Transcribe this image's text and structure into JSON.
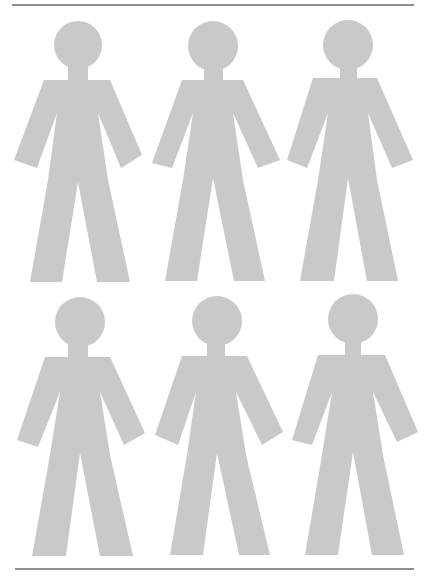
{
  "page": {
    "width": 436,
    "height": 579,
    "background": "#ffffff"
  },
  "colors": {
    "figure_fill": "#c9c9c9",
    "rule_stroke": "#6a6a6a"
  },
  "rules": [
    {
      "name": "top-rule",
      "x1": 12,
      "y1": 5,
      "x2": 414,
      "y2": 5
    },
    {
      "name": "bottom-rule",
      "x1": 15,
      "y1": 569,
      "x2": 414,
      "y2": 569
    }
  ],
  "figures": [
    {
      "id": "figure-1",
      "row": 1,
      "col": 1,
      "head": {
        "cx": 78,
        "cy": 45,
        "r": 24
      },
      "neck": {
        "x": 68,
        "y": 62,
        "w": 20,
        "h": 20
      },
      "body": [
        [
          44,
          80
        ],
        [
          110,
          80
        ],
        [
          142,
          155
        ],
        [
          121,
          168
        ],
        [
          98,
          113
        ],
        [
          108,
          180
        ],
        [
          130,
          282
        ],
        [
          97,
          282
        ],
        [
          78,
          182
        ],
        [
          62,
          282
        ],
        [
          30,
          282
        ],
        [
          48,
          180
        ],
        [
          57,
          113
        ],
        [
          37,
          168
        ],
        [
          14,
          160
        ]
      ]
    },
    {
      "id": "figure-2",
      "row": 1,
      "col": 2,
      "head": {
        "cx": 213,
        "cy": 46,
        "r": 25
      },
      "neck": {
        "x": 204,
        "y": 63,
        "w": 19,
        "h": 19
      },
      "body": [
        [
          182,
          80
        ],
        [
          243,
          80
        ],
        [
          280,
          160
        ],
        [
          258,
          168
        ],
        [
          233,
          113
        ],
        [
          243,
          180
        ],
        [
          265,
          281
        ],
        [
          234,
          281
        ],
        [
          213,
          178
        ],
        [
          197,
          281
        ],
        [
          165,
          281
        ],
        [
          183,
          180
        ],
        [
          193,
          113
        ],
        [
          172,
          168
        ],
        [
          152,
          163
        ]
      ]
    },
    {
      "id": "figure-3",
      "row": 1,
      "col": 3,
      "head": {
        "cx": 348,
        "cy": 45,
        "r": 25
      },
      "neck": {
        "x": 340,
        "y": 62,
        "w": 17,
        "h": 19
      },
      "body": [
        [
          313,
          78
        ],
        [
          377,
          78
        ],
        [
          413,
          160
        ],
        [
          392,
          168
        ],
        [
          368,
          113
        ],
        [
          377,
          180
        ],
        [
          398,
          281
        ],
        [
          367,
          281
        ],
        [
          348,
          178
        ],
        [
          334,
          281
        ],
        [
          300,
          281
        ],
        [
          318,
          180
        ],
        [
          328,
          113
        ],
        [
          307,
          168
        ],
        [
          287,
          160
        ]
      ]
    },
    {
      "id": "figure-4",
      "row": 2,
      "col": 1,
      "head": {
        "cx": 80,
        "cy": 322,
        "r": 25
      },
      "neck": {
        "x": 68,
        "y": 340,
        "w": 20,
        "h": 19
      },
      "body": [
        [
          45,
          357
        ],
        [
          110,
          357
        ],
        [
          145,
          433
        ],
        [
          124,
          445
        ],
        [
          100,
          392
        ],
        [
          110,
          455
        ],
        [
          133,
          556
        ],
        [
          100,
          556
        ],
        [
          80,
          453
        ],
        [
          66,
          556
        ],
        [
          32,
          556
        ],
        [
          50,
          455
        ],
        [
          60,
          392
        ],
        [
          38,
          447
        ],
        [
          17,
          440
        ]
      ]
    },
    {
      "id": "figure-5",
      "row": 2,
      "col": 2,
      "head": {
        "cx": 217,
        "cy": 321,
        "r": 25
      },
      "neck": {
        "x": 207,
        "y": 339,
        "w": 18,
        "h": 19
      },
      "body": [
        [
          182,
          356
        ],
        [
          247,
          356
        ],
        [
          283,
          432
        ],
        [
          262,
          445
        ],
        [
          236,
          392
        ],
        [
          246,
          455
        ],
        [
          270,
          555
        ],
        [
          239,
          555
        ],
        [
          217,
          453
        ],
        [
          203,
          555
        ],
        [
          170,
          555
        ],
        [
          187,
          455
        ],
        [
          196,
          392
        ],
        [
          178,
          445
        ],
        [
          155,
          435
        ]
      ]
    },
    {
      "id": "figure-6",
      "row": 2,
      "col": 3,
      "head": {
        "cx": 353,
        "cy": 319,
        "r": 25
      },
      "neck": {
        "x": 345,
        "y": 337,
        "w": 16,
        "h": 20
      },
      "body": [
        [
          318,
          355
        ],
        [
          385,
          355
        ],
        [
          418,
          432
        ],
        [
          397,
          442
        ],
        [
          373,
          392
        ],
        [
          383,
          455
        ],
        [
          404,
          555
        ],
        [
          372,
          555
        ],
        [
          353,
          452
        ],
        [
          338,
          555
        ],
        [
          305,
          555
        ],
        [
          322,
          455
        ],
        [
          332,
          392
        ],
        [
          312,
          445
        ],
        [
          292,
          440
        ]
      ]
    }
  ]
}
